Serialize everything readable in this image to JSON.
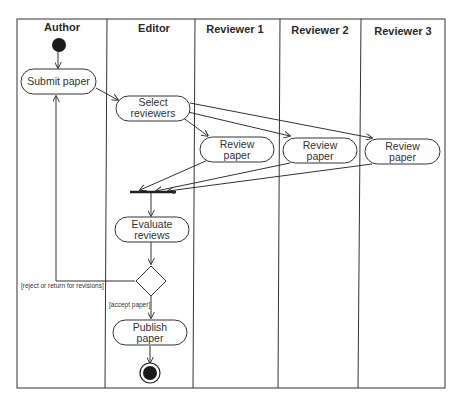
{
  "diagram": {
    "type": "uml-activity-diagram",
    "lanes": [
      {
        "id": "author",
        "title": "Author"
      },
      {
        "id": "editor",
        "title": "Editor"
      },
      {
        "id": "reviewer1",
        "title": "Reviewer 1"
      },
      {
        "id": "reviewer2",
        "title": "Reviewer 2"
      },
      {
        "id": "reviewer3",
        "title": "Reviewer 3"
      }
    ],
    "nodes": {
      "start": {
        "kind": "initial",
        "lane": "author"
      },
      "submit": {
        "kind": "action",
        "lane": "author",
        "line1": "Submit paper",
        "line2": ""
      },
      "select": {
        "kind": "action",
        "lane": "editor",
        "line1": "Select",
        "line2": "reviewers"
      },
      "review1": {
        "kind": "action",
        "lane": "reviewer1",
        "line1": "Review",
        "line2": "paper"
      },
      "review2": {
        "kind": "action",
        "lane": "reviewer2",
        "line1": "Review",
        "line2": "paper"
      },
      "review3": {
        "kind": "action",
        "lane": "reviewer3",
        "line1": "Review",
        "line2": "paper"
      },
      "join": {
        "kind": "join-bar",
        "lane": "editor"
      },
      "evaluate": {
        "kind": "action",
        "lane": "editor",
        "line1": "Evaluate",
        "line2": "reviews"
      },
      "decision": {
        "kind": "decision",
        "lane": "editor"
      },
      "publish": {
        "kind": "action",
        "lane": "editor",
        "line1": "Publish",
        "line2": "paper"
      },
      "end": {
        "kind": "final",
        "lane": "editor"
      }
    },
    "guards": {
      "reject": "[reject or return for revisions]",
      "accept": "[accept paper]"
    },
    "edges": [
      {
        "from": "start",
        "to": "submit"
      },
      {
        "from": "submit",
        "to": "select"
      },
      {
        "from": "select",
        "to": "review1"
      },
      {
        "from": "select",
        "to": "review2"
      },
      {
        "from": "select",
        "to": "review3"
      },
      {
        "from": "review1",
        "to": "join"
      },
      {
        "from": "review2",
        "to": "join"
      },
      {
        "from": "review3",
        "to": "join"
      },
      {
        "from": "join",
        "to": "evaluate"
      },
      {
        "from": "evaluate",
        "to": "decision"
      },
      {
        "from": "decision",
        "to": "submit",
        "guard": "reject"
      },
      {
        "from": "decision",
        "to": "publish",
        "guard": "accept"
      },
      {
        "from": "publish",
        "to": "end"
      }
    ]
  }
}
